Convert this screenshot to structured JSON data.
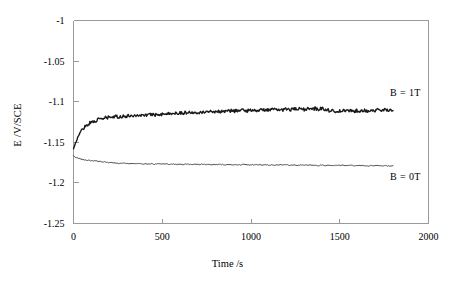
{
  "chart_data": {
    "type": "line",
    "title": "",
    "xlabel": "Time /s",
    "ylabel": "E /V/SCE",
    "xlim": [
      0,
      2000
    ],
    "ylim": [
      -1.25,
      -1.0
    ],
    "xticks": [
      0,
      500,
      1000,
      1500,
      2000
    ],
    "xtick_labels": [
      "0",
      "500",
      "1000",
      "1500",
      "2000"
    ],
    "yticks": [
      -1.0,
      -1.05,
      -1.1,
      -1.15,
      -1.2,
      -1.25
    ],
    "ytick_labels": [
      "-1",
      "-1.05",
      "-1.1",
      "-1.15",
      "-1.2",
      "-1.25"
    ],
    "grid": false,
    "legend_position": "inline-right-annotations",
    "series": [
      {
        "name": "B = 1T",
        "annotation": "B = 1T",
        "annotation_x": 1870,
        "annotation_y": -1.093,
        "color": "#1a1a1a",
        "line_width": 1.4,
        "x": [
          0,
          10,
          20,
          30,
          40,
          50,
          60,
          70,
          80,
          90,
          100,
          110,
          120,
          130,
          140,
          150,
          160,
          170,
          180,
          190,
          200,
          220,
          240,
          260,
          280,
          300,
          320,
          340,
          360,
          380,
          400,
          420,
          440,
          460,
          480,
          500,
          520,
          540,
          560,
          580,
          600,
          620,
          640,
          660,
          680,
          700,
          720,
          740,
          760,
          780,
          800,
          820,
          840,
          860,
          880,
          900,
          920,
          940,
          960,
          980,
          1000,
          1020,
          1040,
          1060,
          1080,
          1100,
          1120,
          1140,
          1160,
          1180,
          1200,
          1220,
          1240,
          1260,
          1280,
          1300,
          1320,
          1340,
          1360,
          1380,
          1400,
          1420,
          1440,
          1460,
          1480,
          1500,
          1520,
          1540,
          1560,
          1580,
          1600,
          1620,
          1640,
          1660,
          1680,
          1700,
          1720,
          1740,
          1760,
          1780,
          1800
        ],
        "y": [
          -1.158,
          -1.152,
          -1.146,
          -1.141,
          -1.137,
          -1.134,
          -1.1315,
          -1.1295,
          -1.128,
          -1.1265,
          -1.1255,
          -1.1245,
          -1.1235,
          -1.1228,
          -1.1222,
          -1.1216,
          -1.1205,
          -1.1212,
          -1.1196,
          -1.1204,
          -1.1188,
          -1.1194,
          -1.1182,
          -1.1188,
          -1.1176,
          -1.1182,
          -1.1168,
          -1.1174,
          -1.1162,
          -1.1172,
          -1.1158,
          -1.1168,
          -1.1152,
          -1.1162,
          -1.1148,
          -1.1156,
          -1.1142,
          -1.1152,
          -1.1138,
          -1.1146,
          -1.1132,
          -1.1142,
          -1.1128,
          -1.1138,
          -1.1124,
          -1.1132,
          -1.1122,
          -1.113,
          -1.1118,
          -1.1126,
          -1.1115,
          -1.1124,
          -1.1112,
          -1.112,
          -1.1108,
          -1.1118,
          -1.1105,
          -1.1114,
          -1.1102,
          -1.1112,
          -1.11,
          -1.111,
          -1.1098,
          -1.1108,
          -1.1095,
          -1.1105,
          -1.1094,
          -1.1104,
          -1.1092,
          -1.1102,
          -1.109,
          -1.11,
          -1.1088,
          -1.1098,
          -1.1086,
          -1.1096,
          -1.1085,
          -1.1094,
          -1.1084,
          -1.1092,
          -1.1082,
          -1.1092,
          -1.1108,
          -1.1116,
          -1.1112,
          -1.1118,
          -1.1112,
          -1.1116,
          -1.111,
          -1.1116,
          -1.1108,
          -1.1114,
          -1.1106,
          -1.1112,
          -1.1104,
          -1.111,
          -1.1102,
          -1.1108,
          -1.1098,
          -1.1104,
          -1.1094
        ]
      },
      {
        "name": "B = 0T",
        "annotation": "B = 0T",
        "annotation_x": 1870,
        "annotation_y": -1.196,
        "color": "#3a3a3a",
        "line_width": 0.9,
        "x": [
          0,
          10,
          20,
          30,
          40,
          50,
          60,
          80,
          100,
          120,
          140,
          160,
          180,
          200,
          220,
          240,
          260,
          280,
          300,
          320,
          340,
          360,
          380,
          400,
          420,
          440,
          460,
          480,
          500,
          520,
          540,
          560,
          580,
          600,
          620,
          640,
          660,
          680,
          700,
          720,
          740,
          760,
          780,
          800,
          820,
          840,
          860,
          880,
          900,
          920,
          940,
          960,
          980,
          1000,
          1020,
          1040,
          1060,
          1080,
          1100,
          1120,
          1140,
          1160,
          1180,
          1200,
          1220,
          1240,
          1260,
          1280,
          1300,
          1320,
          1340,
          1360,
          1380,
          1400,
          1420,
          1440,
          1460,
          1480,
          1500,
          1520,
          1540,
          1560,
          1580,
          1600,
          1620,
          1640,
          1660,
          1680,
          1700,
          1720,
          1740,
          1760,
          1780,
          1800
        ],
        "y": [
          -1.1665,
          -1.1682,
          -1.1694,
          -1.1702,
          -1.1708,
          -1.1712,
          -1.1716,
          -1.1722,
          -1.1726,
          -1.1729,
          -1.1734,
          -1.1738,
          -1.1744,
          -1.1748,
          -1.1752,
          -1.1756,
          -1.1762,
          -1.1758,
          -1.1764,
          -1.176,
          -1.1766,
          -1.1762,
          -1.1768,
          -1.1764,
          -1.1769,
          -1.1764,
          -1.177,
          -1.1765,
          -1.1771,
          -1.1766,
          -1.1772,
          -1.1767,
          -1.1772,
          -1.1768,
          -1.1773,
          -1.1768,
          -1.1774,
          -1.1769,
          -1.1774,
          -1.177,
          -1.1775,
          -1.177,
          -1.1776,
          -1.1771,
          -1.1776,
          -1.1772,
          -1.1777,
          -1.1772,
          -1.1778,
          -1.1773,
          -1.1778,
          -1.1774,
          -1.1779,
          -1.1774,
          -1.178,
          -1.1775,
          -1.178,
          -1.1776,
          -1.1781,
          -1.1776,
          -1.1782,
          -1.1777,
          -1.1782,
          -1.1778,
          -1.1783,
          -1.1778,
          -1.1784,
          -1.1779,
          -1.1784,
          -1.178,
          -1.1785,
          -1.178,
          -1.1786,
          -1.1781,
          -1.1786,
          -1.1782,
          -1.1787,
          -1.1782,
          -1.1788,
          -1.1783,
          -1.1788,
          -1.1784,
          -1.1789,
          -1.1784,
          -1.179,
          -1.1785,
          -1.179,
          -1.1786,
          -1.1791,
          -1.1786,
          -1.1792,
          -1.1787,
          -1.1792,
          -1.1788
        ]
      }
    ]
  },
  "axes": {
    "frame_color": "#9a9a9a",
    "tick_color": "#9a9a9a",
    "background": "#ffffff"
  }
}
